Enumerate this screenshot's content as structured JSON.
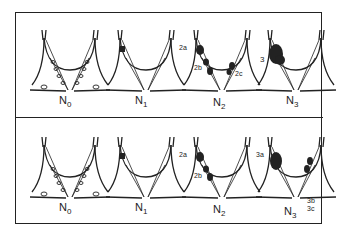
{
  "figure": {
    "rows": [
      {
        "panels": [
          {
            "stage": "N",
            "sub": "0",
            "tags": []
          },
          {
            "stage": "N",
            "sub": "1",
            "tags": []
          },
          {
            "stage": "N",
            "sub": "2",
            "tags": [
              "2a",
              "2b",
              "2c"
            ]
          },
          {
            "stage": "N",
            "sub": "3",
            "tags": [
              "3"
            ]
          }
        ]
      },
      {
        "panels": [
          {
            "stage": "N",
            "sub": "0",
            "tags": []
          },
          {
            "stage": "N",
            "sub": "1",
            "tags": []
          },
          {
            "stage": "N",
            "sub": "2",
            "tags": [
              "2a",
              "2b"
            ]
          },
          {
            "stage": "N",
            "sub": "3",
            "tags": [
              "3a",
              "3b",
              "3c"
            ]
          }
        ]
      }
    ],
    "colors": {
      "ink": "#222222",
      "background": "#ffffff"
    }
  }
}
